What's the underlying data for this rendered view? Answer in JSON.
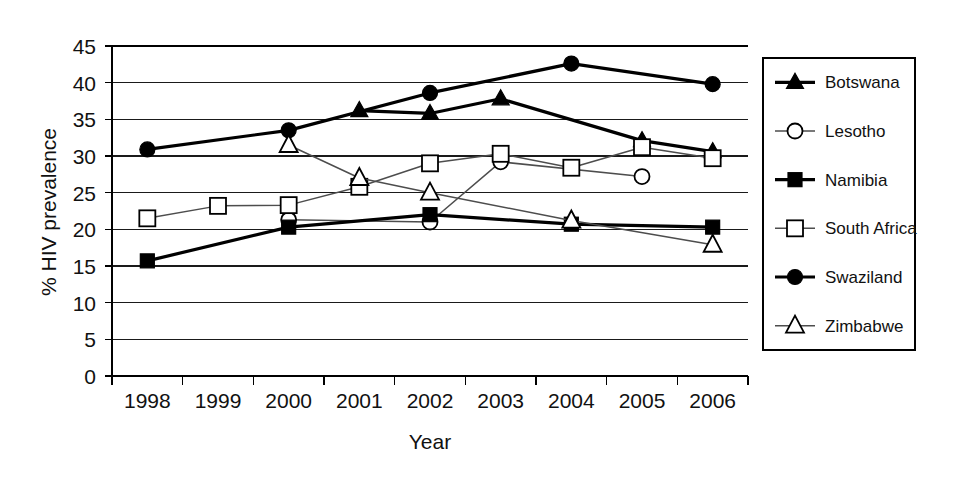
{
  "chart_data": {
    "type": "line",
    "title": "",
    "xlabel": "Year",
    "ylabel": "% HIV prevalence",
    "categories": [
      "1998",
      "1999",
      "2000",
      "2001",
      "2002",
      "2003",
      "2004",
      "2005",
      "2006"
    ],
    "x": [
      1998,
      1999,
      2000,
      2001,
      2002,
      2003,
      2004,
      2005,
      2006
    ],
    "ylim": [
      0,
      45
    ],
    "yticks": [
      "0",
      "5",
      "10",
      "15",
      "20",
      "25",
      "30",
      "35",
      "40",
      "45"
    ],
    "ytick_values": [
      0,
      5,
      10,
      15,
      20,
      25,
      30,
      35,
      40,
      45
    ],
    "grid": "horizontal",
    "legend_position": "right",
    "series": [
      {
        "name": "Botswana",
        "marker": "filled-triangle",
        "line": "thick",
        "values": [
          null,
          null,
          null,
          36.2,
          35.8,
          37.8,
          null,
          32.1,
          30.6
        ]
      },
      {
        "name": "Lesotho",
        "marker": "open-circle",
        "line": "thin",
        "values": [
          null,
          null,
          21.3,
          null,
          21.0,
          29.2,
          null,
          27.2,
          null
        ]
      },
      {
        "name": "Namibia",
        "marker": "filled-square",
        "line": "thick",
        "values": [
          15.7,
          null,
          20.3,
          null,
          22.0,
          null,
          20.7,
          null,
          20.3
        ]
      },
      {
        "name": "South Africa",
        "marker": "open-square",
        "line": "thin",
        "values": [
          21.5,
          23.2,
          23.3,
          25.8,
          29.0,
          30.3,
          28.4,
          31.2,
          29.7
        ]
      },
      {
        "name": "Swaziland",
        "marker": "filled-circle",
        "line": "thick",
        "values": [
          30.9,
          null,
          33.5,
          null,
          38.6,
          null,
          42.6,
          null,
          39.8
        ]
      },
      {
        "name": "Zimbabwe",
        "marker": "open-triangle",
        "line": "thin",
        "values": [
          null,
          null,
          31.5,
          27.0,
          25.0,
          null,
          21.2,
          null,
          17.9
        ]
      }
    ],
    "colors": {
      "line_dark": "#000000",
      "line_gray": "#4d4d4d",
      "marker_fill_open": "#ffffff",
      "text": "#111111",
      "background": "#ffffff"
    }
  }
}
